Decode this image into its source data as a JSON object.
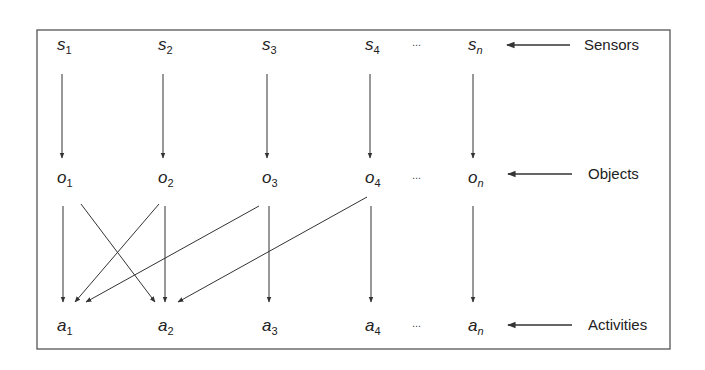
{
  "figure": {
    "frame": {
      "x": 37,
      "y": 30,
      "width": 633,
      "height": 319,
      "stroke": "#555555"
    },
    "line_color": "#333333",
    "label_color": "#222222",
    "rows": [
      {
        "id": "sensors",
        "prefix": "s",
        "y": 50,
        "nodes": [
          {
            "id": "s1",
            "base": "s",
            "sub": "1",
            "x": 62
          },
          {
            "id": "s2",
            "base": "s",
            "sub": "2",
            "x": 163
          },
          {
            "id": "s3",
            "base": "s",
            "sub": "3",
            "x": 267
          },
          {
            "id": "s4",
            "base": "s",
            "sub": "4",
            "x": 370
          },
          {
            "id": "sn",
            "base": "s",
            "sub": "n",
            "x": 473
          }
        ],
        "ellipsis": {
          "text": "...",
          "x": 412
        },
        "label": "Sensors",
        "label_x": 584,
        "arrow": {
          "x1": 570,
          "x2": 507,
          "y": 45
        }
      },
      {
        "id": "objects",
        "prefix": "o",
        "y": 183,
        "nodes": [
          {
            "id": "o1",
            "base": "o",
            "sub": "1",
            "x": 62
          },
          {
            "id": "o2",
            "base": "o",
            "sub": "2",
            "x": 163
          },
          {
            "id": "o3",
            "base": "o",
            "sub": "3",
            "x": 267
          },
          {
            "id": "o4",
            "base": "o",
            "sub": "4",
            "x": 370
          },
          {
            "id": "on",
            "base": "o",
            "sub": "n",
            "x": 473
          }
        ],
        "ellipsis": {
          "text": "...",
          "x": 412
        },
        "label": "Objects",
        "label_x": 588,
        "arrow": {
          "x1": 572,
          "x2": 508,
          "y": 174
        }
      },
      {
        "id": "activities",
        "prefix": "a",
        "y": 331,
        "nodes": [
          {
            "id": "a1",
            "base": "a",
            "sub": "1",
            "x": 62
          },
          {
            "id": "a2",
            "base": "a",
            "sub": "2",
            "x": 163
          },
          {
            "id": "a3",
            "base": "a",
            "sub": "3",
            "x": 267
          },
          {
            "id": "a4",
            "base": "a",
            "sub": "4",
            "x": 370
          },
          {
            "id": "an",
            "base": "a",
            "sub": "n",
            "x": 473
          }
        ],
        "ellipsis": {
          "text": "...",
          "x": 412
        },
        "label": "Activities",
        "label_x": 588,
        "arrow": {
          "x1": 572,
          "x2": 508,
          "y": 325
        }
      }
    ],
    "edges": [
      {
        "from": "s1",
        "to": "o1",
        "x1": 62,
        "y1": 74,
        "x2": 62,
        "y2": 158
      },
      {
        "from": "s2",
        "to": "o2",
        "x1": 163,
        "y1": 74,
        "x2": 163,
        "y2": 158
      },
      {
        "from": "s3",
        "to": "o3",
        "x1": 267,
        "y1": 74,
        "x2": 267,
        "y2": 158
      },
      {
        "from": "s4",
        "to": "o4",
        "x1": 370,
        "y1": 74,
        "x2": 370,
        "y2": 158
      },
      {
        "from": "sn",
        "to": "on",
        "x1": 473,
        "y1": 74,
        "x2": 473,
        "y2": 158
      },
      {
        "from": "o1",
        "to": "a1",
        "x1": 63,
        "y1": 206,
        "x2": 63,
        "y2": 302
      },
      {
        "from": "o1",
        "to": "a2",
        "x1": 81,
        "y1": 204,
        "x2": 155,
        "y2": 302
      },
      {
        "from": "o2",
        "to": "a1",
        "x1": 159,
        "y1": 204,
        "x2": 75,
        "y2": 302
      },
      {
        "from": "o2",
        "to": "a2",
        "x1": 165,
        "y1": 206,
        "x2": 165,
        "y2": 302
      },
      {
        "from": "o3",
        "to": "a1",
        "x1": 259,
        "y1": 206,
        "x2": 86,
        "y2": 302
      },
      {
        "from": "o3",
        "to": "a3",
        "x1": 269,
        "y1": 206,
        "x2": 269,
        "y2": 302
      },
      {
        "from": "o4",
        "to": "a2",
        "x1": 367,
        "y1": 197,
        "x2": 178,
        "y2": 302
      },
      {
        "from": "o4",
        "to": "a4",
        "x1": 371,
        "y1": 206,
        "x2": 371,
        "y2": 302
      },
      {
        "from": "on",
        "to": "an",
        "x1": 473,
        "y1": 206,
        "x2": 473,
        "y2": 302
      }
    ]
  }
}
